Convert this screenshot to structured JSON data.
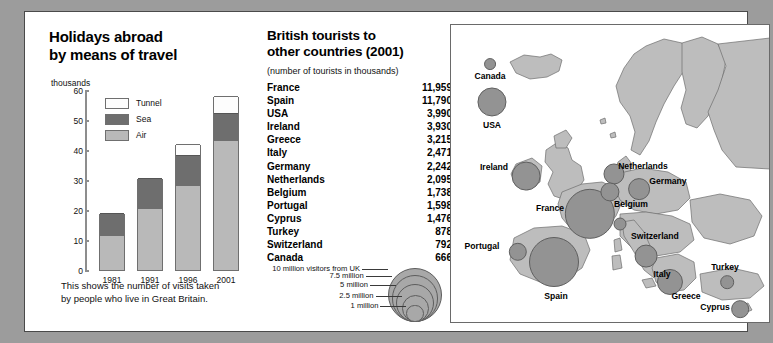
{
  "chart_data": [
    {
      "type": "bar",
      "title": "Holidays abroad by means of travel",
      "title_lines": [
        "Holidays abroad",
        "by means of travel"
      ],
      "ylabel": "thousands",
      "xlabel": "",
      "ylim": [
        0,
        60
      ],
      "yticks": [
        0,
        10,
        20,
        30,
        40,
        50,
        60
      ],
      "categories": [
        "1981",
        "1991",
        "1996",
        "2001"
      ],
      "stacked": true,
      "series": [
        {
          "name": "Air",
          "values": [
            11.3,
            20.3,
            27.9,
            43.0
          ],
          "color": "#b9b9b9"
        },
        {
          "name": "Sea",
          "values": [
            7.8,
            10.4,
            10.6,
            9.5
          ],
          "color": "#6e6e6e"
        },
        {
          "name": "Tunnel",
          "values": [
            0,
            0,
            3.4,
            5.5
          ],
          "color": "#fdfdfd"
        }
      ],
      "totals": [
        19.1,
        30.7,
        41.9,
        58.0
      ],
      "legend": [
        "Tunnel",
        "Sea",
        "Air"
      ],
      "legend_position": "inside-top-left",
      "grid": false,
      "caption": "This shows the number of visits taken by people who live in Great Britain.",
      "caption_lines": [
        "This shows the number of visits taken",
        "by people who live in Great Britain."
      ]
    },
    {
      "type": "table",
      "title": "British tourists to other countries (2001)",
      "title_lines": [
        "British tourists to",
        "other countries (2001)"
      ],
      "subtitle": "(number of tourists in thousands)",
      "columns": [
        "Country",
        "Tourists (thousands)"
      ],
      "rows": [
        {
          "country": "France",
          "value": "11,959"
        },
        {
          "country": "Spain",
          "value": "11,790"
        },
        {
          "country": "USA",
          "value": "3,990"
        },
        {
          "country": "Ireland",
          "value": "3,930"
        },
        {
          "country": "Greece",
          "value": "3,215"
        },
        {
          "country": "Italy",
          "value": "2,471"
        },
        {
          "country": "Germany",
          "value": "2,242"
        },
        {
          "country": "Netherlands",
          "value": "2,095"
        },
        {
          "country": "Belgium",
          "value": "1,738"
        },
        {
          "country": "Portugal",
          "value": "1,598"
        },
        {
          "country": "Cyprus",
          "value": "1,476"
        },
        {
          "country": "Turkey",
          "value": "878"
        },
        {
          "country": "Switzerland",
          "value": "792"
        },
        {
          "country": "Canada",
          "value": "666"
        }
      ]
    },
    {
      "type": "scatter",
      "title": "Map of British tourist destinations",
      "legend_title": "Proportional circle legend",
      "legend_entries": [
        {
          "label": "10 million visitors from UK",
          "value": 10
        },
        {
          "label": "7.5 million",
          "value": 7.5
        },
        {
          "label": "5 million",
          "value": 5
        },
        {
          "label": "2.5 million",
          "value": 2.5
        },
        {
          "label": "1 million",
          "value": 1
        }
      ],
      "points": [
        {
          "label": "Canada",
          "value": 0.666
        },
        {
          "label": "USA",
          "value": 3.99
        },
        {
          "label": "Ireland",
          "value": 3.93
        },
        {
          "label": "France",
          "value": 11.959
        },
        {
          "label": "Spain",
          "value": 11.79
        },
        {
          "label": "Portugal",
          "value": 1.598
        },
        {
          "label": "Netherlands",
          "value": 2.095
        },
        {
          "label": "Belgium",
          "value": 1.738
        },
        {
          "label": "Germany",
          "value": 2.242
        },
        {
          "label": "Switzerland",
          "value": 0.792
        },
        {
          "label": "Italy",
          "value": 2.471
        },
        {
          "label": "Greece",
          "value": 3.215
        },
        {
          "label": "Turkey",
          "value": 0.878
        },
        {
          "label": "Cyprus",
          "value": 1.476
        }
      ]
    }
  ],
  "chart": {
    "title_line1": "Holidays abroad",
    "title_line2": "by means of travel",
    "unit": "thousands",
    "caption_line1": "This shows the number of visits taken",
    "caption_line2": "by people who live in Great Britain."
  },
  "table": {
    "title_line1": "British tourists to",
    "title_line2": "other countries (2001)",
    "subtitle": "(number of tourists in thousands)"
  },
  "colors": {
    "air": "#b9b9b9",
    "sea": "#6e6e6e",
    "tunnel": "#fdfdfd",
    "land": "#bdbdbd",
    "bubble": "#939393",
    "page_background": "#9c9c9c",
    "panel": "#ffffff"
  }
}
